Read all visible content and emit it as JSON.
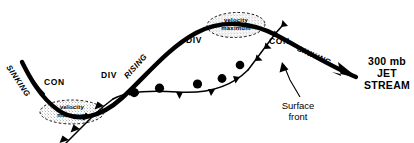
{
  "figure": {
    "background_color": "#ffffff",
    "ink_color": "#000000",
    "width": 414,
    "height": 143
  },
  "jet_stream": {
    "label_line1": "300 mb",
    "label_line2": "JET",
    "label_line3": "STREAM",
    "arrow_tip_x": 358,
    "arrow_tip_y": 78
  },
  "flow_labels": [
    {
      "id": "sinking-left",
      "text": "SINKING",
      "x": 17,
      "y": 70,
      "rotation": 56,
      "style": "flow"
    },
    {
      "id": "con-left",
      "text": "CON",
      "x": 45,
      "y": 83,
      "rotation": 0,
      "style": "plain"
    },
    {
      "id": "div-left",
      "text": "DIV",
      "x": 104,
      "y": 76,
      "rotation": 0,
      "style": "plain"
    },
    {
      "id": "rising",
      "text": "RISING",
      "x": 122,
      "y": 79,
      "rotation": -48,
      "style": "flow"
    },
    {
      "id": "div-top",
      "text": "DIV",
      "x": 187,
      "y": 40,
      "rotation": 0,
      "style": "plain"
    },
    {
      "id": "con-right",
      "text": "CON",
      "x": 270,
      "y": 41,
      "rotation": 0,
      "style": "plain"
    },
    {
      "id": "sinking-right",
      "text": "SINKING",
      "x": 300,
      "y": 48,
      "rotation": 24,
      "style": "flow"
    }
  ],
  "velocity_maxima": [
    {
      "id": "velocity-maximum-trough",
      "line1": "velocity",
      "line2": "maximum",
      "cx": 72,
      "cy": 112,
      "rx": 32,
      "ry": 12,
      "rotation": 0
    },
    {
      "id": "velocity-maximum-ridge",
      "line1": "velocity",
      "line2": "maximum",
      "cx": 236,
      "cy": 25,
      "rx": 29,
      "ry": 12,
      "rotation": -2
    }
  ],
  "surface_front": {
    "label_line1": "Surface",
    "label_line2": "front",
    "label_x": 293,
    "label_y": 108
  }
}
